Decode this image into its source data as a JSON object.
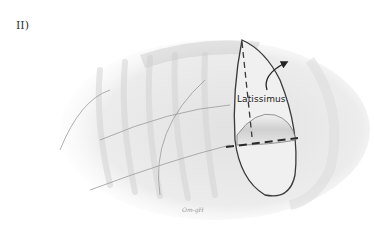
{
  "figure": {
    "panel_label": "II)",
    "annotation": "Latissimus",
    "signature": "Om-gH"
  },
  "colors": {
    "outline": "#3a3a3a",
    "shading": "#d8d8d8",
    "background": "#ffffff"
  }
}
